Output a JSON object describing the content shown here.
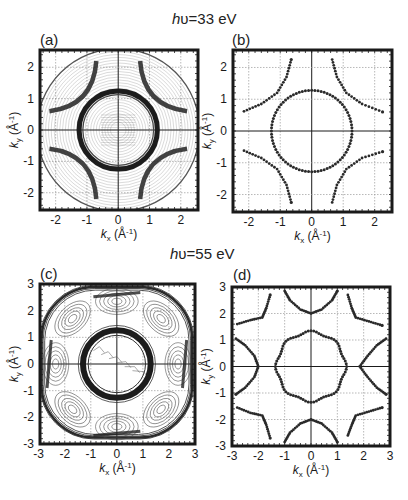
{
  "figure": {
    "row_titles": [
      {
        "prefix": "h",
        "symbol": "υ",
        "text": "=33 eV"
      },
      {
        "prefix": "h",
        "symbol": "υ",
        "text": "=55 eV"
      }
    ],
    "panel_labels": [
      "(a)",
      "(b)",
      "(c)",
      "(d)"
    ],
    "xlabel": "k_x (Å⁻¹)",
    "ylabel": "k_y (Å⁻¹)",
    "colors": {
      "ink": "#1a1a1a",
      "grid": "#9a9a9a",
      "contour": "#3a3a3a",
      "marker": "#2a2a2a"
    }
  },
  "chart_data": [
    {
      "panel": "(a)",
      "type": "contour",
      "title": "hυ=33 eV",
      "xlabel": "k_x (Å^-1)",
      "ylabel": "k_y (Å^-1)",
      "xlim": [
        -2.5,
        2.5
      ],
      "ylim": [
        -2.5,
        2.5
      ],
      "xticks": [
        -2,
        -1,
        0,
        1,
        2
      ],
      "yticks": [
        -2,
        -1,
        0,
        1,
        2
      ],
      "grid": true,
      "features": {
        "measured_region_radius": 2.6,
        "central_circle_radius": 1.25,
        "outer_arcs": [
          {
            "quadrant": "upper-left",
            "from": [
              -2.2,
              0.6
            ],
            "to": [
              -0.7,
              2.2
            ]
          },
          {
            "quadrant": "upper-right",
            "from": [
              0.7,
              2.2
            ],
            "to": [
              2.2,
              0.6
            ]
          },
          {
            "quadrant": "lower-left",
            "from": [
              -2.2,
              -0.6
            ],
            "to": [
              -0.7,
              -2.2
            ]
          },
          {
            "quadrant": "lower-right",
            "from": [
              0.7,
              -2.2
            ],
            "to": [
              2.2,
              -0.6
            ]
          }
        ]
      }
    },
    {
      "panel": "(b)",
      "type": "scatter",
      "title": "hυ=33 eV",
      "xlabel": "k_x (Å^-1)",
      "ylabel": "k_y (Å^-1)",
      "xlim": [
        -2.5,
        2.5
      ],
      "ylim": [
        -2.5,
        2.5
      ],
      "xticks": [
        -2,
        -1,
        0,
        1,
        2
      ],
      "yticks": [
        -2,
        -1,
        0,
        1,
        2
      ],
      "grid": true,
      "series": [
        {
          "name": "central circle",
          "shape": "circle",
          "center": [
            0,
            0
          ],
          "radius": 1.28
        },
        {
          "name": "outer arc UL",
          "points": [
            [
              -2.15,
              0.62
            ],
            [
              -1.6,
              0.85
            ],
            [
              -1.1,
              1.2
            ],
            [
              -0.8,
              1.7
            ],
            [
              -0.65,
              2.25
            ]
          ]
        },
        {
          "name": "outer arc UR",
          "points": [
            [
              0.65,
              2.25
            ],
            [
              0.8,
              1.7
            ],
            [
              1.1,
              1.2
            ],
            [
              1.6,
              0.85
            ],
            [
              2.25,
              0.6
            ]
          ]
        },
        {
          "name": "outer arc LL",
          "points": [
            [
              -2.15,
              -0.62
            ],
            [
              -1.6,
              -0.85
            ],
            [
              -1.1,
              -1.2
            ],
            [
              -0.8,
              -1.7
            ],
            [
              -0.65,
              -2.25
            ]
          ]
        },
        {
          "name": "outer arc LR",
          "points": [
            [
              0.65,
              -2.25
            ],
            [
              0.8,
              -1.7
            ],
            [
              1.1,
              -1.2
            ],
            [
              1.6,
              -0.85
            ],
            [
              2.25,
              -0.65
            ]
          ]
        }
      ]
    },
    {
      "panel": "(c)",
      "type": "contour",
      "title": "hυ=55 eV",
      "xlabel": "k_x (Å^-1)",
      "ylabel": "k_y (Å^-1)",
      "xlim": [
        -3,
        3
      ],
      "ylim": [
        -3,
        3
      ],
      "xticks": [
        -3,
        -2,
        -1,
        0,
        1,
        2,
        3
      ],
      "yticks": [
        -3,
        -2,
        -1,
        0,
        1,
        2,
        3
      ],
      "grid": true,
      "features": {
        "central_ring_radius": 1.3,
        "outer_rounded_square_half_width": 2.95
      }
    },
    {
      "panel": "(d)",
      "type": "scatter",
      "title": "hυ=55 eV",
      "xlabel": "k_x (Å^-1)",
      "ylabel": "k_y (Å^-1)",
      "xlim": [
        -3,
        3
      ],
      "ylim": [
        -3,
        3
      ],
      "xticks": [
        -3,
        -2,
        -1,
        0,
        1,
        2,
        3
      ],
      "yticks": [
        -3,
        -2,
        -1,
        0,
        1,
        2,
        3
      ],
      "grid": true,
      "series": [
        {
          "name": "central scalloped circle",
          "shape": "circle",
          "center": [
            0,
            0
          ],
          "radius": 1.3
        },
        {
          "name": "top arc",
          "points": [
            [
              -1.0,
              2.85
            ],
            [
              -0.8,
              2.5
            ],
            [
              -0.4,
              2.15
            ],
            [
              0,
              2.0
            ],
            [
              0.4,
              2.15
            ],
            [
              0.8,
              2.5
            ],
            [
              1.0,
              2.85
            ]
          ]
        },
        {
          "name": "bottom arc",
          "points": [
            [
              -1.0,
              -2.85
            ],
            [
              -0.8,
              -2.5
            ],
            [
              -0.4,
              -2.15
            ],
            [
              0,
              -2.0
            ],
            [
              0.4,
              -2.15
            ],
            [
              0.8,
              -2.5
            ],
            [
              1.0,
              -2.85
            ]
          ]
        },
        {
          "name": "left arc",
          "points": [
            [
              -2.85,
              1.05
            ],
            [
              -2.5,
              0.8
            ],
            [
              -2.15,
              0.4
            ],
            [
              -2.0,
              0
            ],
            [
              -2.15,
              -0.4
            ],
            [
              -2.5,
              -0.8
            ],
            [
              -2.85,
              -1.05
            ]
          ]
        },
        {
          "name": "right arc",
          "points": [
            [
              2.85,
              1.05
            ],
            [
              2.5,
              0.8
            ],
            [
              2.15,
              0.4
            ],
            [
              1.85,
              0
            ],
            [
              2.15,
              -0.4
            ],
            [
              2.5,
              -0.8
            ],
            [
              2.85,
              -1.05
            ]
          ]
        },
        {
          "name": "corner UL",
          "points": [
            [
              -2.8,
              1.6
            ],
            [
              -2.3,
              1.75
            ],
            [
              -1.85,
              1.85
            ],
            [
              -1.7,
              2.2
            ],
            [
              -1.55,
              2.7
            ]
          ]
        },
        {
          "name": "corner UR",
          "points": [
            [
              1.4,
              2.7
            ],
            [
              1.55,
              2.2
            ],
            [
              1.7,
              1.85
            ],
            [
              2.2,
              1.7
            ],
            [
              2.7,
              1.55
            ]
          ]
        },
        {
          "name": "corner LL",
          "points": [
            [
              -2.8,
              -1.55
            ],
            [
              -2.3,
              -1.75
            ],
            [
              -1.85,
              -1.85
            ],
            [
              -1.7,
              -2.2
            ],
            [
              -1.55,
              -2.7
            ]
          ]
        },
        {
          "name": "corner LR",
          "points": [
            [
              1.4,
              -2.6
            ],
            [
              1.55,
              -2.2
            ],
            [
              1.7,
              -1.85
            ],
            [
              2.2,
              -1.7
            ],
            [
              2.7,
              -1.55
            ]
          ]
        }
      ]
    }
  ]
}
